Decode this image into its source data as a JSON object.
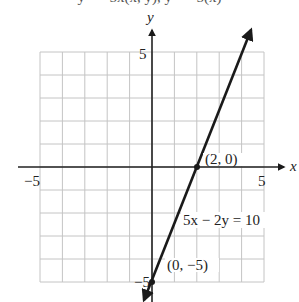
{
  "header_clipped_text": "y = −5x(x, y), y = −5(x)",
  "axes": {
    "x_label": "x",
    "y_label": "y",
    "x_min_label": "−5",
    "x_max_label": "5",
    "y_max_label": "5",
    "y_min_label": "−5"
  },
  "grid": {
    "x_range": [
      -5,
      5
    ],
    "y_range": [
      -5,
      5
    ],
    "step": 1
  },
  "line": {
    "equation": "5x − 2y = 10",
    "color": "#1a1a1a"
  },
  "points": [
    {
      "label": "(2, 0)",
      "x": 2,
      "y": 0
    },
    {
      "label": "(0, −5)",
      "x": 0,
      "y": -5
    }
  ],
  "colors": {
    "grid": "#bdbdbd",
    "axis": "#222222",
    "line": "#1a1a1a"
  }
}
